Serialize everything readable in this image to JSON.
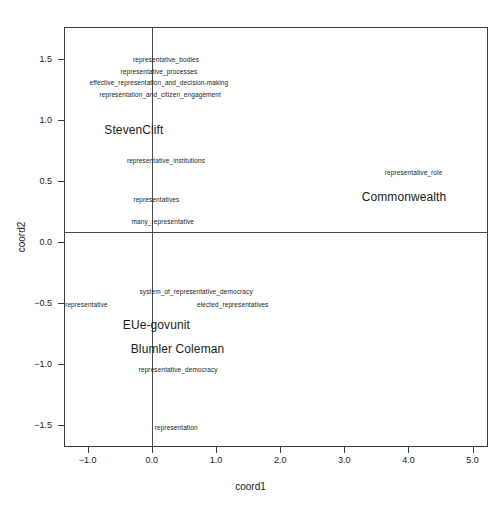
{
  "chart_data": {
    "type": "scatter",
    "title": "",
    "subtitle": "",
    "xlabel": "coord1",
    "ylabel": "coord2",
    "xlim": [
      -1.37,
      5.24
    ],
    "ylim": [
      -1.68,
      1.76
    ],
    "grid": false,
    "legend": "none",
    "reference_lines": {
      "x": 0.0,
      "y": 0.0
    },
    "xticks": [
      {
        "value": -1.0,
        "label": "−1.0"
      },
      {
        "value": 0.0,
        "label": "0.0"
      },
      {
        "value": 1.0,
        "label": "1.0"
      },
      {
        "value": 2.0,
        "label": "2.0"
      },
      {
        "value": 3.0,
        "label": "3.0"
      },
      {
        "value": 4.0,
        "label": "4.0"
      },
      {
        "value": 5.0,
        "label": "5.0"
      }
    ],
    "yticks": [
      {
        "value": 1.5,
        "label": "1.5"
      },
      {
        "value": 1.0,
        "label": "1.0"
      },
      {
        "value": 0.5,
        "label": "0.5"
      },
      {
        "value": 0.0,
        "label": "0.0"
      },
      {
        "value": -0.5,
        "label": "−0.5"
      },
      {
        "value": -1.0,
        "label": "−1.0"
      },
      {
        "value": -1.5,
        "label": "−1.5"
      }
    ],
    "series": [
      {
        "name": "terms",
        "style": "small",
        "points": [
          {
            "label": "representative_bodies",
            "x": 0.22,
            "y": 1.5
          },
          {
            "label": "representative_processes",
            "x": 0.11,
            "y": 1.4
          },
          {
            "label": "effective_representation_and_decision-making",
            "x": 0.11,
            "y": 1.31
          },
          {
            "label": "representation_and_citizen_engagement",
            "x": 0.13,
            "y": 1.21
          },
          {
            "label": "representative_institutions",
            "x": 0.22,
            "y": 0.67
          },
          {
            "label": "representative_role",
            "x": 4.08,
            "y": 0.57
          },
          {
            "label": "representatives",
            "x": 0.07,
            "y": 0.35
          },
          {
            "label": "many_representative",
            "x": 0.17,
            "y": 0.17
          },
          {
            "label": "system_of_representative_democracy",
            "x": 0.69,
            "y": -0.4
          },
          {
            "label": "representative",
            "x": -1.02,
            "y": -0.51
          },
          {
            "label": "elected_representatives",
            "x": 1.26,
            "y": -0.51
          },
          {
            "label": "representative_democracy",
            "x": 0.41,
            "y": -1.04
          },
          {
            "label": "representation",
            "x": 0.38,
            "y": -1.52
          }
        ]
      },
      {
        "name": "sources",
        "style": "big",
        "points": [
          {
            "label": "StevenClift",
            "x": -0.28,
            "y": 0.92
          },
          {
            "label": "Commonwealth",
            "x": 3.93,
            "y": 0.37
          },
          {
            "label": "EUe-govunit",
            "x": 0.07,
            "y": -0.68
          },
          {
            "label": "Blumler Coleman",
            "x": 0.4,
            "y": -0.88
          }
        ]
      }
    ]
  }
}
